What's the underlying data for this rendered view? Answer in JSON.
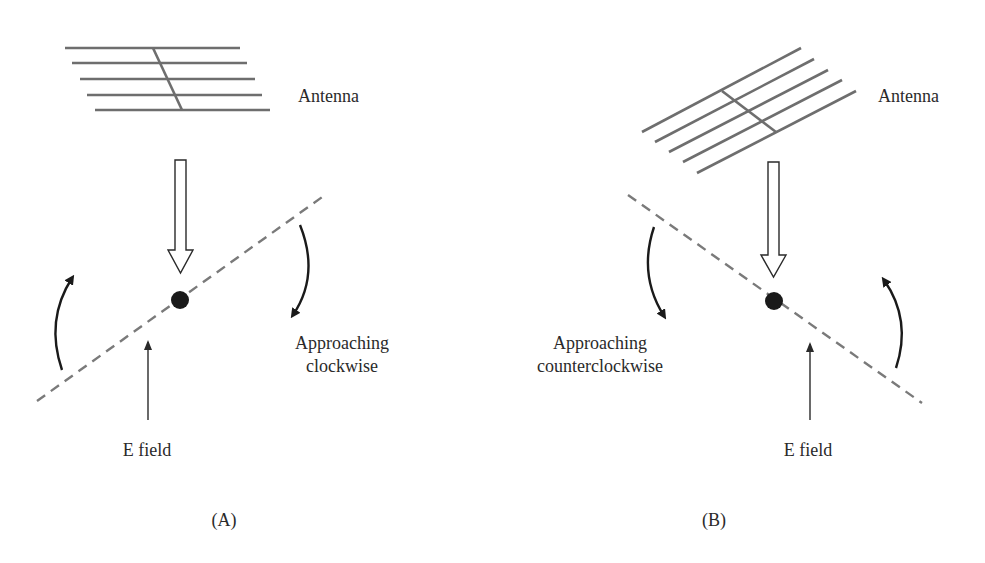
{
  "diagram": {
    "panels": [
      {
        "id": "A",
        "caption": "(A)",
        "antenna_label": "Antenna",
        "rotation_label_line1": "Approaching",
        "rotation_label_line2": "clockwise",
        "field_label": "E field",
        "antenna_orientation": "horizontal",
        "e_field_line_slope": "rising to the right"
      },
      {
        "id": "B",
        "caption": "(B)",
        "antenna_label": "Antenna",
        "rotation_label_line1": "Approaching",
        "rotation_label_line2": "counterclockwise",
        "field_label": "E field",
        "antenna_orientation": "tilted",
        "e_field_line_slope": "falling to the right"
      }
    ],
    "colors": {
      "antenna_rods": "#6e6e6e",
      "field_line": "#7a7a7a",
      "arrows": "#1a1a1a",
      "text": "#2a2a2a",
      "background": "#ffffff"
    }
  }
}
